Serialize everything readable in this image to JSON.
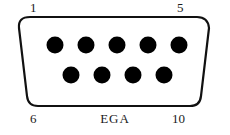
{
  "diagram": {
    "connector_name": "EGA",
    "connector_type": "DE-9 female D-subminiature",
    "shell": {
      "outline_color": "#111111",
      "fill_color": "#ffffff",
      "stroke_width": 2
    },
    "pin_color": "#000000",
    "label_color": "#1a1a1a",
    "labels": {
      "top_left": "1",
      "top_right": "5",
      "bottom_left": "6",
      "bottom_right": "10",
      "center_bottom": "EGA"
    },
    "rows": [
      {
        "name": "top-row",
        "pin_count": 5,
        "pins": [
          {
            "number": "1",
            "cx": 55,
            "cy": 45
          },
          {
            "number": "2",
            "cx": 86,
            "cy": 45
          },
          {
            "number": "3",
            "cx": 117,
            "cy": 45
          },
          {
            "number": "4",
            "cx": 148,
            "cy": 45
          },
          {
            "number": "5",
            "cx": 179,
            "cy": 45
          }
        ]
      },
      {
        "name": "bottom-row",
        "pin_count": 4,
        "pins": [
          {
            "number": "6",
            "cx": 71,
            "cy": 75
          },
          {
            "number": "7",
            "cx": 102,
            "cy": 75
          },
          {
            "number": "8",
            "cx": 133,
            "cy": 75
          },
          {
            "number": "9",
            "cx": 164,
            "cy": 75
          }
        ]
      }
    ],
    "pin_radius": 8.5,
    "total_pins": 9
  }
}
